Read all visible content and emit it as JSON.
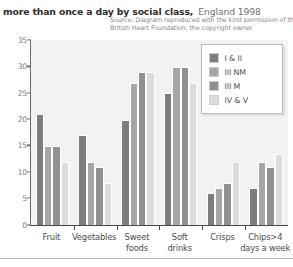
{
  "title": {
    "main": "more than once a day by social class,",
    "sub": "England 1998"
  },
  "source": {
    "line1": "Source: Diagram reproduced with the kind permission of the",
    "line2": "British Heart Foundation, the copyright owner."
  },
  "chart_data": {
    "type": "bar",
    "title": "more than once a day by social class, England 1998",
    "xlabel": "",
    "ylabel": "",
    "ylim": [
      0,
      35
    ],
    "yticks": [
      0,
      5,
      10,
      15,
      20,
      25,
      30,
      35
    ],
    "ytick_labels": [
      "0",
      "5",
      "10",
      "15",
      "20",
      "25",
      "30",
      "35"
    ],
    "grid": false,
    "legend_position": "top-right",
    "categories": [
      "Fruit",
      "Vegetables",
      "Sweet foods",
      "Soft drinks",
      "Crisps",
      "Chips>4 days a week"
    ],
    "category_label_lines": [
      [
        "Fruit"
      ],
      [
        "Vegetables"
      ],
      [
        "Sweet",
        "foods"
      ],
      [
        "Soft",
        "drinks"
      ],
      [
        "Crisps"
      ],
      [
        "Chips>4",
        "days a week"
      ]
    ],
    "series": [
      {
        "name": "I & II",
        "color": "#7d7d7d",
        "values": [
          21,
          17,
          20,
          25,
          6,
          7
        ]
      },
      {
        "name": "III NM",
        "color": "#a6a6a6",
        "values": [
          15,
          12,
          27,
          30,
          7,
          12
        ]
      },
      {
        "name": "III M",
        "color": "#919191",
        "values": [
          15,
          11,
          29,
          30,
          8,
          11
        ]
      },
      {
        "name": "IV & V",
        "color": "#dcdcdc",
        "values": [
          12,
          8,
          29,
          27,
          12,
          13.5
        ]
      }
    ]
  }
}
